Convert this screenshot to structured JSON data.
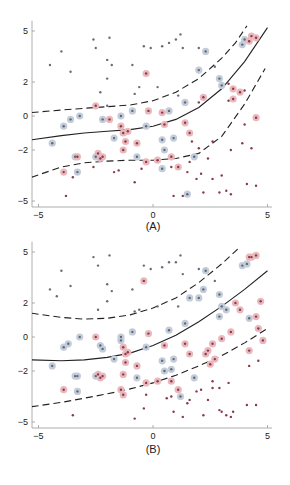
{
  "chart_data": [
    {
      "type": "scatter",
      "title": "",
      "panel_label": "(A)",
      "xlabel": "",
      "ylabel": "",
      "xlim": [
        -5.3,
        5.2
      ],
      "ylim": [
        -5.3,
        5.6
      ],
      "xticks": [
        -5,
        0,
        5
      ],
      "xtick_labels": [
        "-5",
        "0",
        "5"
      ],
      "yticks": [
        5,
        2,
        0,
        -2,
        -5
      ],
      "ytick_labels": [
        "5",
        "2",
        "0",
        "-2",
        "-5"
      ],
      "grid": false,
      "legend": null,
      "colors": {
        "class_pos": "#c0504d",
        "class_neg": "#5b7fa8",
        "dot": "#6a5a6a",
        "halo_pos": "#e9b8bd",
        "halo_neg": "#c4ccd8",
        "line": "#222222"
      },
      "curves": [
        {
          "name": "decision_boundary",
          "style": "solid",
          "x": [
            -5.3,
            -4,
            -3,
            -2,
            -1,
            0,
            1,
            2,
            3,
            4,
            5
          ],
          "y": [
            -1.4,
            -1.15,
            -1.0,
            -0.9,
            -0.8,
            -0.6,
            -0.2,
            0.5,
            1.6,
            3.2,
            5.2
          ]
        },
        {
          "name": "margin_upper",
          "style": "dashed",
          "x": [
            -5.3,
            -4,
            -3,
            -2,
            -1,
            0,
            1,
            2,
            3,
            3.6,
            4.1
          ],
          "y": [
            0.2,
            0.35,
            0.45,
            0.55,
            0.65,
            0.9,
            1.4,
            2.2,
            3.4,
            4.3,
            5.3
          ]
        },
        {
          "name": "margin_lower",
          "style": "dashed",
          "x": [
            -5.3,
            -4,
            -3,
            -2,
            -1,
            0,
            1,
            2,
            3,
            4,
            4.9
          ],
          "y": [
            -3.6,
            -3.0,
            -2.75,
            -2.65,
            -2.6,
            -2.6,
            -2.5,
            -2.2,
            -1.2,
            0.7,
            2.8
          ]
        }
      ],
      "points_neg_unselected": [
        [
          -4.0,
          3.8
        ],
        [
          -4.5,
          3.0
        ],
        [
          -3.6,
          2.6
        ],
        [
          -2.6,
          4.5
        ],
        [
          -2.5,
          4.0
        ],
        [
          -1.9,
          4.6
        ],
        [
          -2.0,
          3.3
        ],
        [
          -1.8,
          3.0
        ],
        [
          -2.0,
          2.2
        ],
        [
          -2.3,
          1.4
        ],
        [
          -2.0,
          0.6
        ],
        [
          -0.4,
          4.1
        ],
        [
          -0.9,
          3.0
        ],
        [
          -0.6,
          1.7
        ],
        [
          0.7,
          4.3
        ],
        [
          0.4,
          4.1
        ],
        [
          -0.8,
          1.3
        ],
        [
          0.2,
          1.7
        ],
        [
          -0.1,
          4.0
        ],
        [
          1.2,
          4.8
        ],
        [
          1.0,
          4.5
        ],
        [
          1.1,
          1.2
        ],
        [
          2.0,
          4.0
        ],
        [
          2.7,
          2.9
        ],
        [
          1.3,
          4.0
        ]
      ],
      "points_pos_unselected": [
        [
          -3.5,
          -3.6
        ],
        [
          -2.6,
          -3.0
        ],
        [
          -1.7,
          -3.3
        ],
        [
          -1.5,
          -3.2
        ],
        [
          -0.8,
          -3.9
        ],
        [
          -0.5,
          -3.1
        ],
        [
          -3.8,
          -4.7
        ],
        [
          0.8,
          -3.0
        ],
        [
          1.5,
          -3.3
        ],
        [
          1.6,
          -2.7
        ],
        [
          1.9,
          -3.7
        ],
        [
          2.1,
          -3.4
        ],
        [
          2.4,
          -2.5
        ],
        [
          2.6,
          -3.7
        ],
        [
          3.0,
          -3.5
        ],
        [
          3.2,
          -4.4
        ],
        [
          3.4,
          -4.6
        ],
        [
          0.9,
          -4.7
        ],
        [
          1.3,
          -4.7
        ],
        [
          2.2,
          -4.5
        ],
        [
          2.9,
          -4.5
        ],
        [
          4.1,
          -4.0
        ],
        [
          4.5,
          -4.1
        ],
        [
          2.0,
          -1.9
        ],
        [
          2.6,
          -1.5
        ],
        [
          4.0,
          -0.5
        ],
        [
          3.9,
          -1.6
        ],
        [
          4.3,
          -1.9
        ],
        [
          2.0,
          0.8
        ],
        [
          3.3,
          0.9
        ],
        [
          4.0,
          1.5
        ],
        [
          3.4,
          -2.0
        ],
        [
          1.7,
          -1.5
        ],
        [
          3.3,
          1.9
        ]
      ],
      "points_neg_sv": [
        [
          -4.4,
          -1.6
        ],
        [
          -3.9,
          -0.6
        ],
        [
          -3.6,
          -0.2
        ],
        [
          -3.2,
          0.0
        ],
        [
          -2.2,
          -0.2
        ],
        [
          -3.4,
          -2.4
        ],
        [
          -2.5,
          -2.4
        ],
        [
          -1.7,
          -1.3
        ],
        [
          -0.3,
          -0.6
        ],
        [
          0.4,
          -1.4
        ],
        [
          -0.7,
          -2.4
        ],
        [
          -0.9,
          0.3
        ],
        [
          0.9,
          -1.3
        ],
        [
          0.5,
          -2.0
        ],
        [
          0.7,
          0.3
        ],
        [
          -3.3,
          -3.3
        ],
        [
          -1.4,
          0.0
        ],
        [
          1.8,
          -2.4
        ],
        [
          1.4,
          0.8
        ],
        [
          2.3,
          3.8
        ],
        [
          2.0,
          2.7
        ],
        [
          2.9,
          2.2
        ],
        [
          3.0,
          1.8
        ],
        [
          3.9,
          4.2
        ],
        [
          4.0,
          4.5
        ],
        [
          1.5,
          -4.6
        ],
        [
          0.4,
          -3.1
        ]
      ],
      "points_pos_sv": [
        [
          -2.5,
          0.6
        ],
        [
          -1.4,
          -0.6
        ],
        [
          -1.3,
          -1.0
        ],
        [
          -1.1,
          -0.9
        ],
        [
          -1.2,
          -1.5
        ],
        [
          -1.3,
          -2.0
        ],
        [
          -0.7,
          -1.6
        ],
        [
          -1.9,
          -0.2
        ],
        [
          -3.3,
          -2.4
        ],
        [
          -2.4,
          -2.2
        ],
        [
          -2.3,
          -2.5
        ],
        [
          -2.2,
          -2.4
        ],
        [
          -3.9,
          -3.3
        ],
        [
          -0.2,
          0.3
        ],
        [
          0.4,
          0.2
        ],
        [
          0.5,
          -0.5
        ],
        [
          1.4,
          -0.4
        ],
        [
          1.6,
          -1.0
        ],
        [
          0.2,
          -2.6
        ],
        [
          -0.3,
          -2.7
        ],
        [
          0.8,
          -2.4
        ],
        [
          3.5,
          1.0
        ],
        [
          3.8,
          1.4
        ],
        [
          3.5,
          1.6
        ],
        [
          4.2,
          4.4
        ],
        [
          4.5,
          4.6
        ],
        [
          4.3,
          4.7
        ],
        [
          1.1,
          -3.0
        ],
        [
          4.5,
          -0.1
        ],
        [
          2.2,
          1.1
        ],
        [
          -0.3,
          2.5
        ]
      ]
    },
    {
      "type": "scatter",
      "title": "",
      "panel_label": "(B)",
      "xlabel": "",
      "ylabel": "",
      "xlim": [
        -5.3,
        5.2
      ],
      "ylim": [
        -5.3,
        5.6
      ],
      "xticks": [
        -5,
        0,
        5
      ],
      "xtick_labels": [
        "-5",
        "0",
        "5"
      ],
      "yticks": [
        5,
        2,
        0,
        -2,
        -5
      ],
      "ytick_labels": [
        "5",
        "2",
        "0",
        "-2",
        "-5"
      ],
      "grid": false,
      "legend": null,
      "colors": {
        "class_pos": "#c0504d",
        "class_neg": "#5b7fa8",
        "dot": "#6a5a6a",
        "halo_pos": "#e9b8bd",
        "halo_neg": "#c4ccd8",
        "line": "#222222"
      },
      "curves": [
        {
          "name": "decision_boundary",
          "style": "solid",
          "x": [
            -5.3,
            -4,
            -3,
            -2,
            -1,
            0,
            1,
            2,
            3,
            4,
            5
          ],
          "y": [
            -1.35,
            -1.4,
            -1.35,
            -1.2,
            -0.95,
            -0.5,
            0.1,
            0.9,
            1.8,
            2.8,
            3.9
          ]
        },
        {
          "name": "margin_upper",
          "style": "dashed",
          "x": [
            -5.3,
            -4,
            -3,
            -2,
            -1,
            0,
            1,
            2,
            3,
            3.8
          ],
          "y": [
            1.4,
            1.15,
            1.05,
            1.1,
            1.3,
            1.7,
            2.3,
            3.2,
            4.3,
            5.3
          ]
        },
        {
          "name": "margin_lower",
          "style": "dashed",
          "x": [
            -5.3,
            -4,
            -3,
            -2,
            -1,
            0,
            1,
            2,
            3,
            4,
            5
          ],
          "y": [
            -4.1,
            -3.85,
            -3.6,
            -3.35,
            -3.05,
            -2.7,
            -2.25,
            -1.7,
            -1.1,
            -0.35,
            0.5
          ]
        }
      ],
      "points_neg_unselected": [
        [
          -4.0,
          3.9
        ],
        [
          -4.5,
          2.8
        ],
        [
          -4.2,
          2.4
        ],
        [
          -3.6,
          3.0
        ],
        [
          -2.6,
          4.7
        ],
        [
          -2.4,
          4.2
        ],
        [
          -1.9,
          4.8
        ],
        [
          -2.0,
          3.1
        ],
        [
          -1.8,
          2.7
        ],
        [
          -2.0,
          2.1
        ],
        [
          -2.4,
          1.6
        ],
        [
          -0.4,
          4.2
        ],
        [
          -0.9,
          2.8
        ],
        [
          -0.6,
          1.6
        ],
        [
          0.7,
          4.4
        ],
        [
          0.4,
          4.1
        ],
        [
          -0.8,
          1.5
        ],
        [
          0.2,
          1.8
        ],
        [
          -0.1,
          4.0
        ],
        [
          1.2,
          4.8
        ],
        [
          1.0,
          4.4
        ],
        [
          1.1,
          1.8
        ],
        [
          2.0,
          4.0
        ],
        [
          2.7,
          3.3
        ],
        [
          1.3,
          3.7
        ]
      ],
      "points_pos_unselected": [
        [
          -3.5,
          -4.6
        ],
        [
          -0.8,
          -4.8
        ],
        [
          0.8,
          -3.5
        ],
        [
          1.5,
          -3.9
        ],
        [
          1.6,
          -3.7
        ],
        [
          1.9,
          -3.2
        ],
        [
          2.1,
          -3.1
        ],
        [
          2.4,
          -3.7
        ],
        [
          2.6,
          -3.0
        ],
        [
          3.0,
          -4.4
        ],
        [
          3.2,
          -4.6
        ],
        [
          3.4,
          -4.7
        ],
        [
          0.9,
          -4.4
        ],
        [
          1.3,
          -4.7
        ],
        [
          2.2,
          -4.6
        ],
        [
          2.9,
          -4.3
        ],
        [
          4.1,
          -4.0
        ],
        [
          4.5,
          -4.0
        ],
        [
          3.5,
          -4.4
        ],
        [
          4.2,
          -1.7
        ],
        [
          4.6,
          -1.4
        ],
        [
          2.6,
          -2.6
        ],
        [
          3.3,
          -2.7
        ],
        [
          2.9,
          -3.0
        ],
        [
          0.6,
          -3.6
        ],
        [
          -0.3,
          -3.4
        ],
        [
          -0.4,
          -4.2
        ]
      ],
      "points_neg_sv": [
        [
          -4.4,
          -1.7
        ],
        [
          -3.9,
          -0.6
        ],
        [
          -3.7,
          -0.4
        ],
        [
          -3.2,
          0.0
        ],
        [
          -2.3,
          -0.5
        ],
        [
          -2.2,
          -0.7
        ],
        [
          -3.4,
          -2.3
        ],
        [
          -3.3,
          -2.3
        ],
        [
          -2.5,
          -2.3
        ],
        [
          -1.7,
          -1.3
        ],
        [
          -0.3,
          -0.6
        ],
        [
          0.4,
          -1.4
        ],
        [
          -0.7,
          -2.4
        ],
        [
          -0.9,
          0.3
        ],
        [
          0.9,
          -1.3
        ],
        [
          0.5,
          -2.0
        ],
        [
          0.7,
          0.4
        ],
        [
          -3.3,
          -3.2
        ],
        [
          -1.4,
          0.0
        ],
        [
          1.8,
          -2.4
        ],
        [
          1.4,
          0.8
        ],
        [
          2.3,
          3.9
        ],
        [
          2.0,
          2.3
        ],
        [
          2.9,
          2.5
        ],
        [
          3.0,
          1.8
        ],
        [
          3.9,
          4.2
        ],
        [
          4.1,
          4.3
        ],
        [
          3.2,
          1.6
        ],
        [
          2.9,
          1.2
        ],
        [
          4.2,
          1.1
        ],
        [
          1.2,
          -3.5
        ],
        [
          0.8,
          -1.9
        ],
        [
          2.2,
          2.8
        ],
        [
          1.6,
          2.3
        ],
        [
          -1.4,
          -0.2
        ]
      ],
      "points_pos_sv": [
        [
          -2.5,
          0.0
        ],
        [
          -1.3,
          -0.6
        ],
        [
          -1.2,
          -1.0
        ],
        [
          -1.1,
          -0.9
        ],
        [
          -1.2,
          -1.5
        ],
        [
          -1.3,
          -2.2
        ],
        [
          -0.7,
          -1.7
        ],
        [
          -2.4,
          -2.2
        ],
        [
          -2.3,
          -2.4
        ],
        [
          -2.2,
          -2.3
        ],
        [
          -3.9,
          -3.1
        ],
        [
          -1.4,
          -3.1
        ],
        [
          -1.3,
          -3.4
        ],
        [
          -0.2,
          0.2
        ],
        [
          0.5,
          -0.5
        ],
        [
          1.4,
          -0.4
        ],
        [
          1.6,
          -1.0
        ],
        [
          0.2,
          -2.6
        ],
        [
          -0.3,
          -2.7
        ],
        [
          0.8,
          -2.6
        ],
        [
          2.4,
          -0.8
        ],
        [
          2.6,
          -0.4
        ],
        [
          3.0,
          -0.1
        ],
        [
          3.4,
          0.3
        ],
        [
          2.5,
          -1.6
        ],
        [
          4.2,
          -0.8
        ],
        [
          4.6,
          0.5
        ],
        [
          4.2,
          4.7
        ],
        [
          4.5,
          4.8
        ],
        [
          4.3,
          4.7
        ],
        [
          3.6,
          2.0
        ],
        [
          3.8,
          1.6
        ],
        [
          4.5,
          1.2
        ],
        [
          2.3,
          -1.0
        ],
        [
          2.7,
          -1.3
        ],
        [
          4.8,
          -0.2
        ],
        [
          1.1,
          -3.1
        ],
        [
          -0.4,
          3.3
        ],
        [
          4.7,
          2.1
        ]
      ]
    }
  ],
  "panels": {
    "a": {
      "label": "(A)"
    },
    "b": {
      "label": "(B)"
    }
  }
}
